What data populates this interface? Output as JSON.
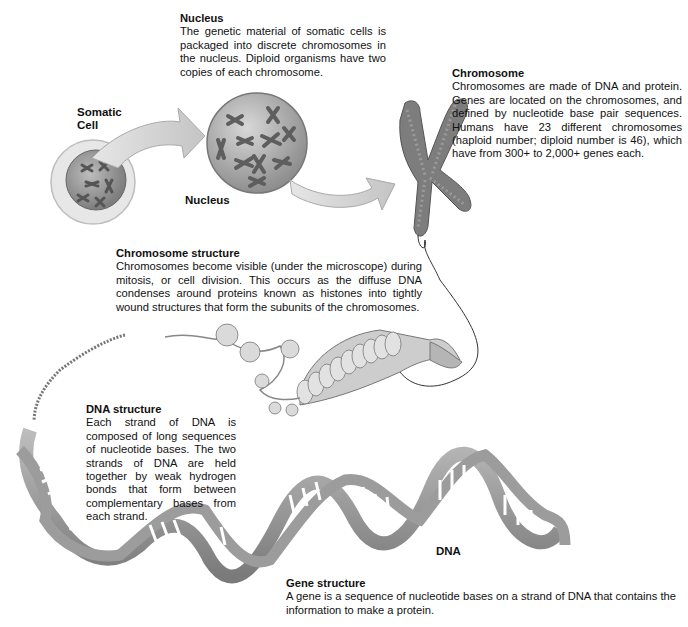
{
  "diagram": {
    "labels": {
      "somatic_cell": "Somatic\nCell",
      "somatic_cell_line1": "Somatic",
      "somatic_cell_line2": "Cell",
      "nucleus": "Nucleus",
      "dna": "DNA"
    },
    "blocks": {
      "nucleus": {
        "title": "Nucleus",
        "body": "The genetic material of somatic cells is packaged into discrete chromosomes in the nucleus. Diploid organisms have two copies of each chromosome."
      },
      "chromosome": {
        "title": "Chromosome",
        "body": "Chromosomes are made of DNA and protein. Genes are located on the chromosomes, and defined by nucleotide base pair sequences. Humans have 23 different chromosomes (haploid number; diploid number is 46), which have from 300+ to 2,000+ genes each."
      },
      "chromosome_structure": {
        "title": "Chromosome structure",
        "body": "Chromosomes become visible (under the microscope) during mitosis, or cell division. This occurs as the diffuse DNA condenses around proteins known as histones into tightly wound structures that form the subunits of the chromosomes."
      },
      "dna_structure": {
        "title": "DNA structure",
        "body": "Each strand of DNA is composed of long sequences of nucleotide bases. The two strands of DNA are held together by weak hydrogen bonds that form between complementary bases from each strand."
      },
      "gene_structure": {
        "title": "Gene structure",
        "body": "A gene is a sequence of nucleotide bases on a strand of DNA that contains the information to make a protein."
      }
    },
    "colors": {
      "ink": "#111111",
      "grey_dark": "#6e6e6e",
      "grey_mid": "#9a9a9a",
      "grey_light": "#cfcfcf",
      "arrow": "#c8c8c8"
    }
  }
}
